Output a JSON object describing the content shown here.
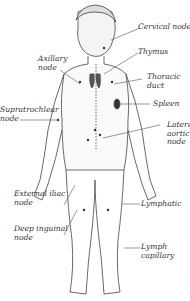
{
  "diagram": {
    "labels": {
      "cervical_node": "Cervical node",
      "thymus": "Thymus",
      "axillary_node": "Axillary\nnode",
      "thoracic_duct": "Thoracic\nduct",
      "supratrochlear_node": "Supratrochlear\nnode",
      "spleen": "Spleen",
      "lateral_aortic_node": "Latera\naortic\nnode",
      "external_iliac_node": "External iliac\nnode",
      "lymphatic": "Lymphatic",
      "deep_inguinal_node": "Deep inguinal\nnode",
      "lymph_capillary": "Lymph\ncapillary"
    }
  }
}
